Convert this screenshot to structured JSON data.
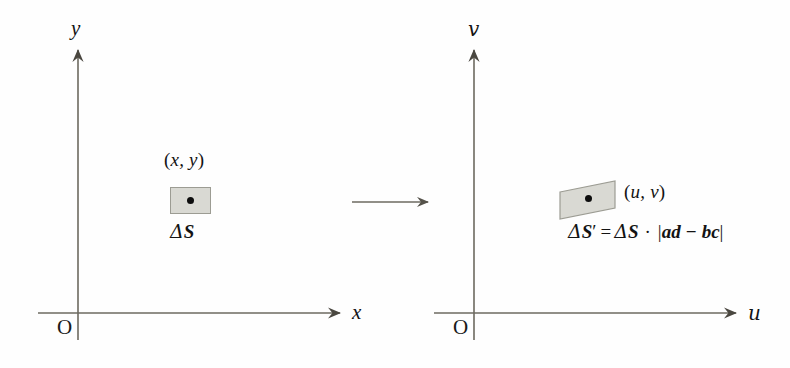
{
  "diagram": {
    "title_text": "",
    "colors": {
      "axis": "#6d6a60",
      "ink": "#131313",
      "patch_fill": "#d9d9d3",
      "patch_stroke": "#9c9c93",
      "dot": "#0d0d0d"
    },
    "left_plane": {
      "name": "xy-plane",
      "y_axis_label": "y",
      "x_axis_label": "x",
      "origin_label": "O",
      "patch": {
        "shape": "rectangle",
        "point_label_open": "(",
        "point_label_body": "x, y",
        "point_label_close": ")",
        "area_label_delta": "Δ",
        "area_label_symbol": "S"
      }
    },
    "right_plane": {
      "name": "uv-plane",
      "y_axis_label": "v",
      "x_axis_label": "u",
      "origin_label": "O",
      "patch": {
        "shape": "parallelogram",
        "point_label_open": "(",
        "point_label_body": "u, v",
        "point_label_close": ")",
        "formula": {
          "lhs_delta": "Δ",
          "lhs_symbol": "S",
          "lhs_prime": "′",
          "equals": "=",
          "rhs_delta": "Δ",
          "rhs_symbol": "S",
          "dot_operator": "·",
          "abs_open": "|",
          "determinant": "ad − bc",
          "abs_close": "|",
          "full_text": "ΔS′ = ΔS · |ad − bc|"
        }
      }
    },
    "transform_arrow": {
      "label": "",
      "direction": "left-to-right"
    }
  }
}
